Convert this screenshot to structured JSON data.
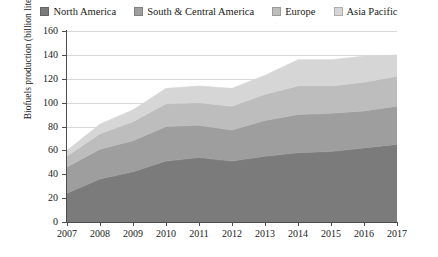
{
  "chart_data": {
    "type": "area",
    "stacked": true,
    "title": "",
    "xlabel": "",
    "ylabel": "Biofuels production (billion liters)",
    "x": [
      2007,
      2008,
      2009,
      2010,
      2011,
      2012,
      2013,
      2014,
      2015,
      2016,
      2017
    ],
    "categories": [
      "2007",
      "2008",
      "2009",
      "2010",
      "2011",
      "2012",
      "2013",
      "2014",
      "2015",
      "2016",
      "2017"
    ],
    "xtick_labels": [
      "2007",
      "2008",
      "2009",
      "2010",
      "2011",
      "2012",
      "2013",
      "2014",
      "2015",
      "2016",
      "2017"
    ],
    "ytick_labels": [
      "0",
      "20",
      "40",
      "60",
      "80",
      "100",
      "120",
      "140",
      "160"
    ],
    "yticks": [
      0,
      20,
      40,
      60,
      80,
      100,
      120,
      140,
      160
    ],
    "ylim": [
      0,
      160
    ],
    "xlim": [
      2007,
      2017
    ],
    "grid": true,
    "grid_axis": "y",
    "legend_position": "top",
    "series": [
      {
        "name": "North America",
        "color": "#7b7b7b",
        "values": [
          24,
          36,
          42,
          51,
          54,
          51,
          55,
          58,
          59,
          62,
          65
        ]
      },
      {
        "name": "South & Central America",
        "color": "#9e9e9e",
        "values": [
          22,
          25,
          26,
          29,
          27,
          26,
          30,
          32,
          32,
          31,
          32
        ]
      },
      {
        "name": "Europe",
        "color": "#bdbdbd",
        "values": [
          9,
          13,
          16,
          19,
          19,
          20,
          22,
          24,
          23,
          24,
          25
        ]
      },
      {
        "name": "Asia Pacific",
        "color": "#d6d6d6",
        "values": [
          5,
          8,
          10,
          13,
          14,
          15,
          16,
          22,
          22,
          22,
          18
        ]
      }
    ],
    "totals": [
      60,
      82,
      94,
      112,
      114,
      112,
      123,
      136,
      136,
      139,
      140
    ]
  },
  "legend": {
    "items": [
      {
        "label": "North America",
        "color": "#7b7b7b"
      },
      {
        "label": "South & Central America",
        "color": "#9e9e9e"
      },
      {
        "label": "Europe",
        "color": "#bdbdbd"
      },
      {
        "label": "Asia Pacific",
        "color": "#d6d6d6"
      }
    ]
  },
  "axes": {
    "y_axis_title": "Biofuels production (billion liters)"
  }
}
